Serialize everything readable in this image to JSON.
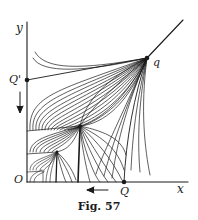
{
  "figure": {
    "caption": "Fig. 57",
    "labels": {
      "y_axis": "y",
      "x_axis": "x",
      "origin": "O",
      "q_prime": "Q'",
      "q_big": "Q",
      "q_small": "q"
    },
    "colors": {
      "ink": "#1a1a1a",
      "background": "#ffffff"
    }
  }
}
